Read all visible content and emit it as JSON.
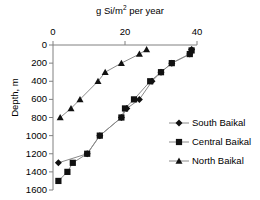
{
  "chart_data": {
    "type": "scatter",
    "title": "g Si/m2 per year",
    "title_prefix": "g Si/m",
    "title_sup": "2",
    "title_suffix": " per year",
    "xlabel": "g Si/m2 per year",
    "ylabel": "Depth, m",
    "xlim": [
      0,
      40
    ],
    "ylim": [
      0,
      1600
    ],
    "y_inverted": true,
    "x_axis_position": "top",
    "grid": false,
    "legend_position": "right",
    "xticks": [
      0,
      20,
      40
    ],
    "xtick_labels": [
      "0",
      "20",
      "40"
    ],
    "yticks": [
      0,
      200,
      400,
      600,
      800,
      1000,
      1200,
      1400,
      1600
    ],
    "ytick_labels": [
      "0",
      "200",
      "400",
      "600",
      "800",
      "1000",
      "1200",
      "1400",
      "1600"
    ],
    "series": [
      {
        "name": "South Baikal",
        "marker": "diamond",
        "color": "#000000",
        "points": [
          {
            "x": 38.5,
            "y": 50
          },
          {
            "x": 38.0,
            "y": 100
          },
          {
            "x": 33.0,
            "y": 200
          },
          {
            "x": 30.0,
            "y": 300
          },
          {
            "x": 27.5,
            "y": 400
          },
          {
            "x": 24.0,
            "y": 600
          },
          {
            "x": 20.5,
            "y": 700
          },
          {
            "x": 19.0,
            "y": 800
          },
          {
            "x": 13.0,
            "y": 1000
          },
          {
            "x": 9.5,
            "y": 1200
          },
          {
            "x": 1.5,
            "y": 1300
          }
        ]
      },
      {
        "name": "Central Baikal",
        "marker": "square",
        "color": "#000000",
        "points": [
          {
            "x": 38.5,
            "y": 60
          },
          {
            "x": 38.0,
            "y": 100
          },
          {
            "x": 33.0,
            "y": 200
          },
          {
            "x": 30.0,
            "y": 300
          },
          {
            "x": 27.0,
            "y": 400
          },
          {
            "x": 22.5,
            "y": 600
          },
          {
            "x": 20.0,
            "y": 700
          },
          {
            "x": 19.0,
            "y": 800
          },
          {
            "x": 13.0,
            "y": 1000
          },
          {
            "x": 9.5,
            "y": 1200
          },
          {
            "x": 5.5,
            "y": 1300
          },
          {
            "x": 4.0,
            "y": 1400
          },
          {
            "x": 1.5,
            "y": 1500
          }
        ]
      },
      {
        "name": "North Baikal",
        "marker": "triangle",
        "color": "#000000",
        "points": [
          {
            "x": 26.0,
            "y": 50
          },
          {
            "x": 24.0,
            "y": 100
          },
          {
            "x": 19.0,
            "y": 200
          },
          {
            "x": 14.5,
            "y": 300
          },
          {
            "x": 12.5,
            "y": 400
          },
          {
            "x": 7.5,
            "y": 600
          },
          {
            "x": 5.0,
            "y": 700
          },
          {
            "x": 2.0,
            "y": 800
          }
        ]
      }
    ]
  },
  "legend": {
    "items": [
      {
        "label": "South Baikal",
        "marker": "diamond"
      },
      {
        "label": "Central Baikal",
        "marker": "square"
      },
      {
        "label": "North Baikal",
        "marker": "triangle"
      }
    ]
  }
}
